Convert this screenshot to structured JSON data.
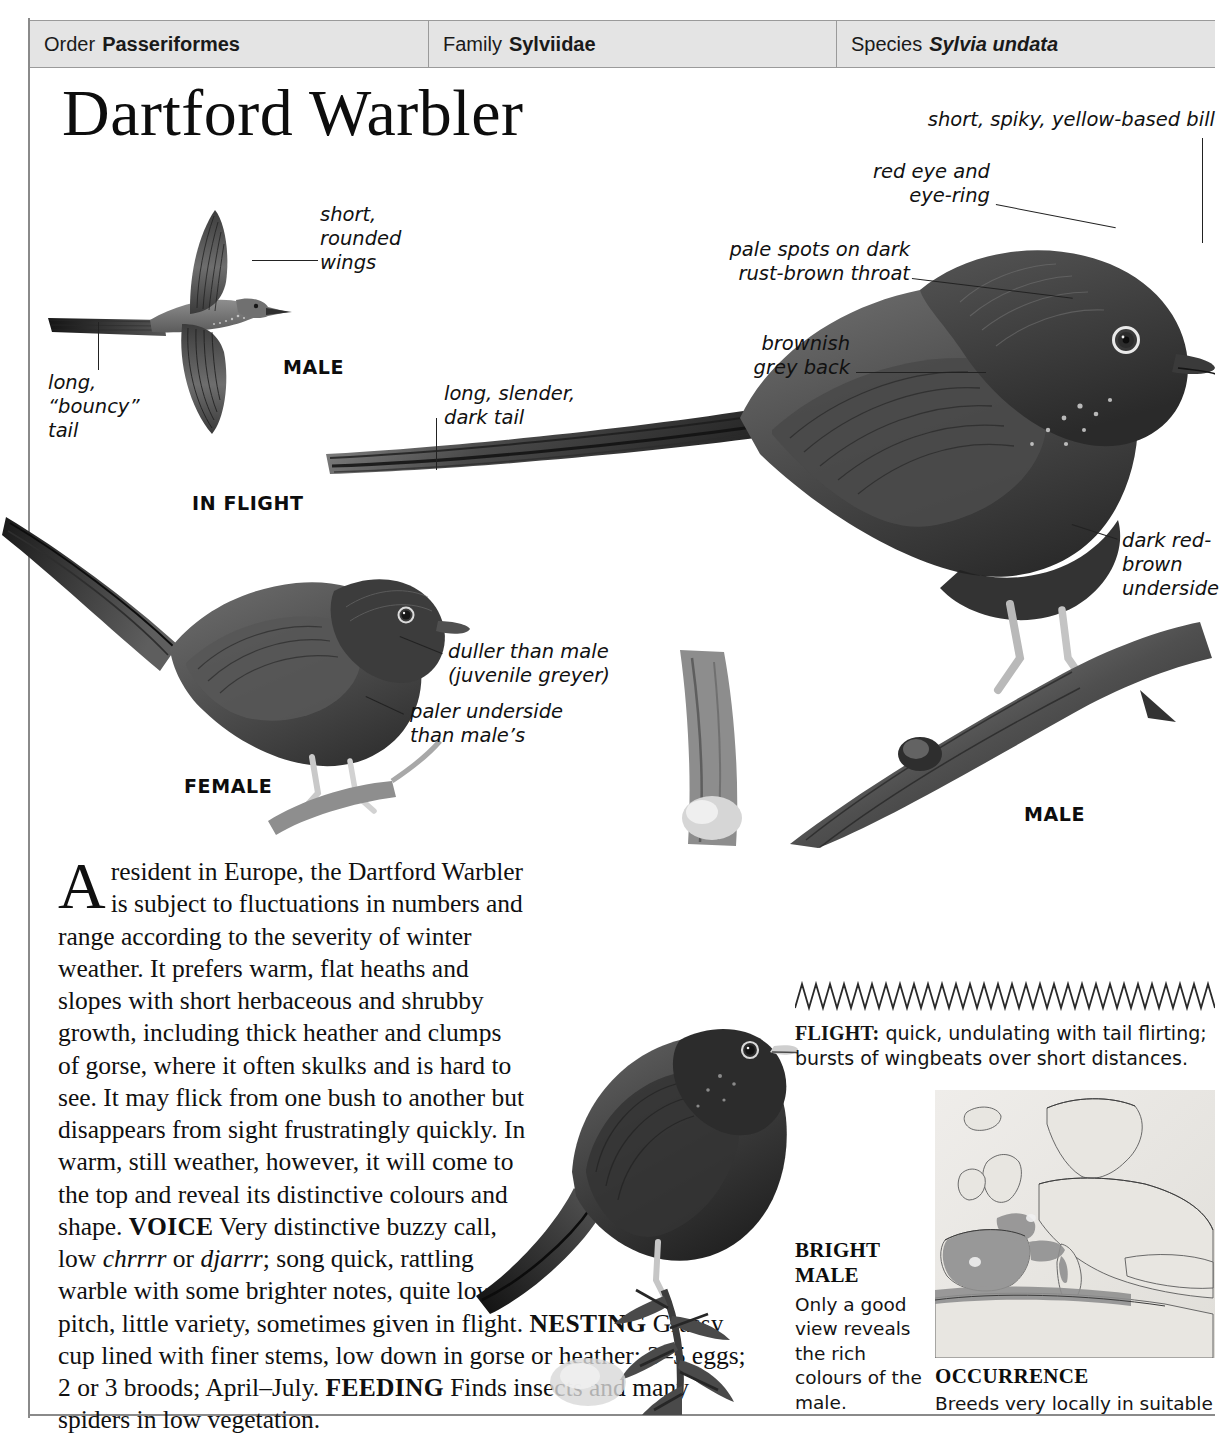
{
  "taxonomy": [
    {
      "label": "Order",
      "value": "Passeriformes",
      "italic": false
    },
    {
      "label": "Family",
      "value": "Sylviidae",
      "italic": false
    },
    {
      "label": "Species",
      "value": "Sylvia undata",
      "italic": true
    }
  ],
  "title": "Dartford Warbler",
  "annotations": {
    "short_rounded_wings": "short,\nrounded\nwings",
    "long_bouncy_tail": "long,\n“bouncy”\ntail",
    "long_slender_dark_tail": "long, slender,\ndark tail",
    "short_spiky_bill": "short, spiky, yellow-based bill",
    "red_eye_and_eyering": "red eye and\neye-ring",
    "pale_spots_throat": "pale spots on dark\nrust-brown throat",
    "brownish_grey_back": "brownish\ngrey back",
    "dark_red_brown_underside": "dark red-\nbrown\nunderside",
    "duller_than_male": "duller than male\n(juvenile greyer)",
    "paler_underside": "paler underside\nthan male’s"
  },
  "captions": {
    "male_flight": "MALE",
    "in_flight": "IN FLIGHT",
    "female": "FEMALE",
    "male_perched": "MALE"
  },
  "article": {
    "dropcap": "A",
    "opening": "resident in Europe, the Dartford Warbler is subject to fluctuations in numbers and range according to the severity of winter weather. It prefers warm, flat heaths and slopes with short herbaceous and shrubby growth, including thick heather and clumps of gorse, where it often skulks and is hard to see. It may flick from one bush to another but disappears from sight frustratingly quickly. In warm, still weather, however, it will come to the top and reveal its distinctive colours and shape.",
    "voice_head": "VOICE",
    "voice_part1": "Very distinctive buzzy call, low ",
    "voice_italic1": "chrrrr",
    "voice_part2": " or ",
    "voice_italic2": "djarrr",
    "voice_part3": "; song quick, rattling warble with some brighter notes, quite low pitch, little variety, sometimes given in flight.",
    "nesting_head": "NESTING",
    "nesting_body": "Grassy cup lined with finer stems, low down in gorse or heather; 3–5 eggs; 2 or 3 broods; April–July.",
    "feeding_head": "FEEDING",
    "feeding_body": "Finds insects and many spiders in low vegetation."
  },
  "flight_panel": {
    "head": "FLIGHT:",
    "body": " quick, undulating with tail flirting; bursts of wingbeats over short distances."
  },
  "bright_male": {
    "title_line1": "BRIGHT",
    "title_line2": "MALE",
    "body": "Only a good view reveals the rich colours of the male."
  },
  "occurrence": {
    "title": "OCCURRENCE",
    "body": "Breeds very locally in suitable"
  },
  "colors": {
    "header_bg": "#e4e4e4",
    "rule": "#8a8a8a",
    "ink": "#111111",
    "map_land": "#e3e1dd",
    "map_range": "#8e8e8e"
  }
}
